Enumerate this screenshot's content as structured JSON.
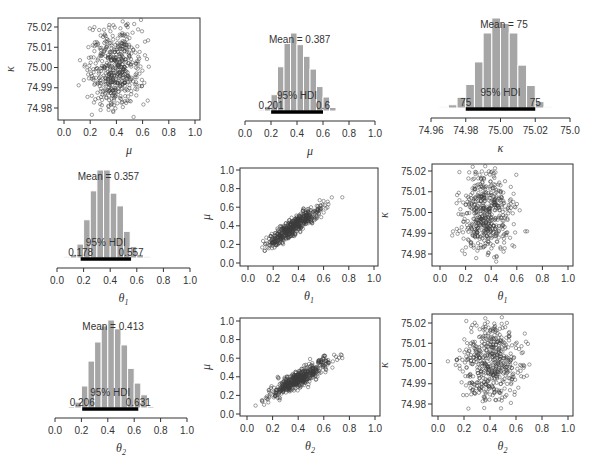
{
  "chart_data": [
    {
      "id": "scatter_mu_kappa",
      "type": "scatter",
      "row": 1,
      "col": 1,
      "xlabel": "μ",
      "ylabel": "κ",
      "xlim": [
        0.0,
        1.0
      ],
      "ylim": [
        74.975,
        75.022
      ],
      "xticks": [
        "0.0",
        "0.2",
        "0.4",
        "0.6",
        "0.8",
        "1.0"
      ],
      "yticks": [
        "74.98",
        "74.99",
        "75.00",
        "75.01",
        "75.02"
      ],
      "x_center": 0.387,
      "x_sd": 0.1,
      "y_center": 75.0,
      "y_sd": 0.01,
      "n_points": 500
    },
    {
      "id": "hist_mu",
      "type": "bar",
      "row": 1,
      "col": 2,
      "xlabel": "μ",
      "xlim": [
        0.0,
        1.0
      ],
      "xticks": [
        "0.0",
        "0.2",
        "0.4",
        "0.6",
        "0.8",
        "1.0"
      ],
      "bin_edges": [
        0.1,
        0.15,
        0.2,
        0.25,
        0.3,
        0.35,
        0.4,
        0.45,
        0.5,
        0.55,
        0.6,
        0.65,
        0.7
      ],
      "values": [
        1,
        4,
        14,
        38,
        58,
        67,
        57,
        47,
        36,
        21,
        12,
        3
      ],
      "mean_label": "Mean = 0.387",
      "hdi_label": "95% HDI",
      "hdi_low": "0.201",
      "hdi_high": "0.6",
      "hdi": [
        0.201,
        0.6
      ]
    },
    {
      "id": "hist_kappa",
      "type": "bar",
      "row": 1,
      "col": 3,
      "xlabel": "κ",
      "xlim": [
        74.96,
        75.04
      ],
      "xticks": [
        "74.96",
        "74.98",
        "75.00",
        "75.02",
        "75.0"
      ],
      "bin_edges": [
        74.965,
        74.97,
        74.975,
        74.98,
        74.985,
        74.99,
        74.995,
        75.0,
        75.005,
        75.01,
        75.015,
        75.02,
        75.025,
        75.03
      ],
      "values": [
        1,
        3,
        10,
        22,
        43,
        70,
        84,
        79,
        70,
        40,
        21,
        6,
        1
      ],
      "mean_label": "Mean = 75",
      "hdi_label": "95% HDI",
      "hdi_low": "75",
      "hdi_high": "75",
      "hdi": [
        74.98,
        75.02
      ]
    },
    {
      "id": "hist_theta1",
      "type": "bar",
      "row": 2,
      "col": 1,
      "xlabel": "θ1",
      "xlim": [
        0.0,
        1.0
      ],
      "xticks": [
        "0.0",
        "0.2",
        "0.4",
        "0.6",
        "0.8",
        "1.0"
      ],
      "bin_edges": [
        0.05,
        0.1,
        0.15,
        0.2,
        0.25,
        0.3,
        0.35,
        0.4,
        0.45,
        0.5,
        0.55,
        0.6,
        0.65,
        0.7
      ],
      "values": [
        1,
        3,
        12,
        33,
        58,
        76,
        76,
        56,
        45,
        23,
        10,
        3,
        1
      ],
      "mean_label": "Mean = 0.357",
      "hdi_label": "95% HDI",
      "hdi_low": "0.178",
      "hdi_high": "0.557",
      "hdi": [
        0.178,
        0.557
      ]
    },
    {
      "id": "scatter_theta1_mu",
      "type": "scatter",
      "row": 2,
      "col": 2,
      "xlabel": "θ1",
      "ylabel": "μ",
      "xlim": [
        -0.04,
        1.04
      ],
      "ylim": [
        -0.04,
        1.04
      ],
      "xticks": [
        "0.0",
        "0.2",
        "0.4",
        "0.6",
        "0.8",
        "1.0"
      ],
      "yticks": [
        "0.0",
        "0.2",
        "0.4",
        "0.6",
        "0.8",
        "1.0"
      ],
      "x_center": 0.357,
      "x_sd": 0.1,
      "y_center": 0.387,
      "y_sd": 0.1,
      "correlation": 0.88,
      "n_points": 500
    },
    {
      "id": "scatter_theta1_kappa",
      "type": "scatter",
      "row": 2,
      "col": 3,
      "xlabel": "θ1",
      "ylabel": "κ",
      "xlim": [
        -0.04,
        1.04
      ],
      "ylim": [
        74.975,
        75.023
      ],
      "xticks": [
        "0.0",
        "0.2",
        "0.4",
        "0.6",
        "0.8",
        "1.0"
      ],
      "yticks": [
        "74.98",
        "74.99",
        "75.00",
        "75.01",
        "75.02"
      ],
      "x_center": 0.357,
      "x_sd": 0.1,
      "y_center": 75.0,
      "y_sd": 0.01,
      "n_points": 500
    },
    {
      "id": "hist_theta2",
      "type": "bar",
      "row": 3,
      "col": 1,
      "xlabel": "θ2",
      "xlim": [
        0.0,
        1.0
      ],
      "xticks": [
        "0.0",
        "0.2",
        "0.4",
        "0.6",
        "0.8",
        "1.0"
      ],
      "bin_edges": [
        0.1,
        0.15,
        0.2,
        0.25,
        0.3,
        0.35,
        0.4,
        0.45,
        0.5,
        0.55,
        0.6,
        0.65,
        0.7,
        0.75
      ],
      "values": [
        1,
        4,
        15,
        32,
        45,
        56,
        60,
        54,
        43,
        27,
        17,
        9,
        1
      ],
      "mean_label": "Mean = 0.413",
      "hdi_label": "95% HDI",
      "hdi_low": "0.206",
      "hdi_high": "0.631",
      "hdi": [
        0.206,
        0.631
      ]
    },
    {
      "id": "scatter_theta2_mu",
      "type": "scatter",
      "row": 3,
      "col": 2,
      "xlabel": "θ2",
      "ylabel": "μ",
      "xlim": [
        -0.04,
        1.04
      ],
      "ylim": [
        -0.04,
        1.04
      ],
      "xticks": [
        "0.0",
        "0.2",
        "0.4",
        "0.6",
        "0.8",
        "1.0"
      ],
      "yticks": [
        "0.0",
        "0.2",
        "0.4",
        "0.6",
        "0.8",
        "1.0"
      ],
      "x_center": 0.413,
      "x_sd": 0.11,
      "y_center": 0.387,
      "y_sd": 0.1,
      "correlation": 0.88,
      "n_points": 500
    },
    {
      "id": "scatter_theta2_kappa",
      "type": "scatter",
      "row": 3,
      "col": 3,
      "xlabel": "θ2",
      "ylabel": "κ",
      "xlim": [
        -0.04,
        1.04
      ],
      "ylim": [
        74.975,
        75.023
      ],
      "xticks": [
        "0.0",
        "0.2",
        "0.4",
        "0.6",
        "0.8",
        "1.0"
      ],
      "yticks": [
        "74.98",
        "74.99",
        "75.00",
        "75.01",
        "75.02"
      ],
      "x_center": 0.413,
      "x_sd": 0.11,
      "y_center": 75.0,
      "y_sd": 0.01,
      "n_points": 500
    }
  ],
  "colors": {
    "bar_fill": "#a6a6a6",
    "bar_edge": "#ffffff",
    "point_stroke": "#3a3a3a",
    "axis": "#333333",
    "hdi_bar": "#000000"
  }
}
